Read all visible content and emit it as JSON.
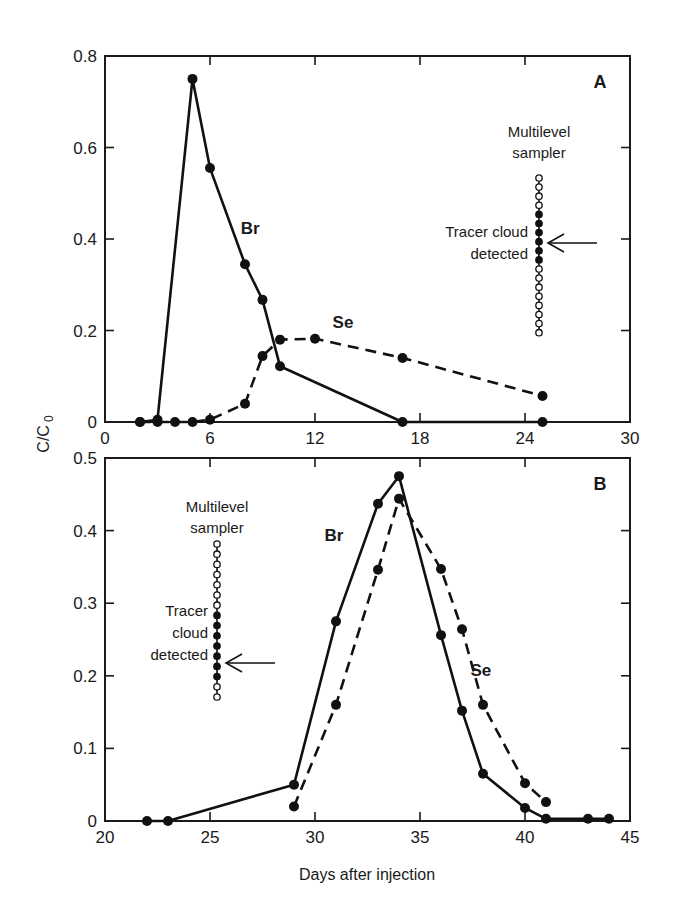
{
  "chart_data": [
    {
      "panel": "A",
      "type": "line",
      "xlabel": "",
      "ylabel": "C/C0",
      "xlim": [
        0,
        30
      ],
      "ylim": [
        0,
        0.8
      ],
      "xticks": [
        0,
        6,
        12,
        18,
        24,
        30
      ],
      "xtick_labels": [
        "0",
        "6",
        "12",
        "18",
        "24",
        "30"
      ],
      "yticks": [
        0,
        0.2,
        0.4,
        0.6,
        0.8
      ],
      "ytick_labels": [
        "0",
        "0.2",
        "0.4",
        "0.6",
        "0.8"
      ],
      "grid": false,
      "series": [
        {
          "name": "Br",
          "style": "solid",
          "x": [
            2,
            3,
            5,
            6,
            8,
            9,
            10,
            17,
            25
          ],
          "y": [
            0,
            0.005,
            0.75,
            0.555,
            0.345,
            0.267,
            0.122,
            0,
            0
          ]
        },
        {
          "name": "Se",
          "style": "dashed",
          "x": [
            2,
            3,
            4,
            5,
            6,
            8,
            9,
            10,
            12,
            17,
            25
          ],
          "y": [
            0,
            0,
            0,
            0,
            0.005,
            0.04,
            0.144,
            0.18,
            0.182,
            0.14,
            0.057
          ]
        }
      ],
      "annotations": {
        "panel_letter": "A",
        "sampler_title_line1": "Multilevel",
        "sampler_title_line2": "sampler",
        "detected_line1": "Tracer cloud",
        "detected_line2": "detected",
        "sampler_pattern": [
          "o",
          "o",
          "o",
          "o",
          "f",
          "f",
          "f",
          "f",
          "f",
          "f",
          "o",
          "o",
          "o",
          "o",
          "o",
          "o",
          "o",
          "o"
        ],
        "series_labels": [
          {
            "text": "Br",
            "x": 8.3,
            "y": 0.41
          },
          {
            "text": "Se",
            "x": 13.6,
            "y": 0.205
          }
        ]
      }
    },
    {
      "panel": "B",
      "type": "line",
      "xlabel": "Days after injection",
      "ylabel": "C/C0",
      "xlim": [
        20,
        45
      ],
      "ylim": [
        0,
        0.5
      ],
      "xticks": [
        20,
        25,
        30,
        35,
        40,
        45
      ],
      "xtick_labels": [
        "20",
        "25",
        "30",
        "35",
        "40",
        "45"
      ],
      "yticks": [
        0,
        0.1,
        0.2,
        0.3,
        0.4,
        0.5
      ],
      "ytick_labels": [
        "0",
        "0.1",
        "0.2",
        "0.3",
        "0.4",
        "0.5"
      ],
      "grid": false,
      "series": [
        {
          "name": "Br",
          "style": "solid",
          "x": [
            22,
            23,
            29,
            31,
            33,
            34,
            36,
            37,
            38,
            40,
            41,
            43,
            44
          ],
          "y": [
            0,
            0,
            0.05,
            0.275,
            0.437,
            0.475,
            0.256,
            0.152,
            0.065,
            0.018,
            0.003,
            0.003,
            0.003
          ]
        },
        {
          "name": "Se",
          "style": "dashed",
          "x": [
            29,
            31,
            33,
            34,
            36,
            37,
            38,
            40,
            41
          ],
          "y": [
            0.02,
            0.16,
            0.346,
            0.444,
            0.347,
            0.264,
            0.16,
            0.052,
            0.026
          ]
        }
      ],
      "annotations": {
        "panel_letter": "B",
        "sampler_title_line1": "Multilevel",
        "sampler_title_line2": "sampler",
        "detected_line1": "Tracer",
        "detected_line2": "cloud",
        "detected_line3": "detected",
        "sampler_pattern": [
          "o",
          "o",
          "o",
          "o",
          "o",
          "o",
          "o",
          "f",
          "f",
          "f",
          "f",
          "f",
          "f",
          "f",
          "o",
          "o"
        ],
        "series_labels": [
          {
            "text": "Br",
            "x": 30.9,
            "y": 0.385
          },
          {
            "text": "Se",
            "x": 37.9,
            "y": 0.2
          }
        ]
      }
    }
  ],
  "figure": {
    "y_axis_title": "C/C",
    "y_axis_title_sub": "0",
    "x_axis_title": "Days after injection"
  }
}
